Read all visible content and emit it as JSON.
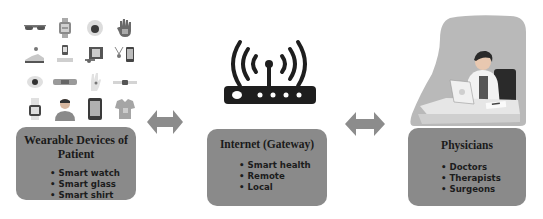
{
  "diagram": {
    "colors": {
      "box_fill": "#8a8a8a",
      "arrow_fill": "#8c8c8c",
      "router_fill": "#1e1e1e",
      "physician_bg": "#b9b9b9"
    },
    "nodes": [
      {
        "id": "patient",
        "title": "Wearable Devices of Patient",
        "title_line1": "Wearable Devices of",
        "title_line2": "Patient",
        "items": [
          "Smart watch",
          "Smart glass",
          "Smart shirt"
        ],
        "illustration": "wearable-devices-icon-grid"
      },
      {
        "id": "gateway",
        "title": "Internet (Gateway)",
        "items": [
          "Smart health",
          "Remote",
          "Local"
        ],
        "illustration": "wifi-router-icon"
      },
      {
        "id": "physicians",
        "title": "Physicians",
        "items": [
          "Doctors",
          "Therapists",
          "Surgeons"
        ],
        "illustration": "doctor-at-desk-illustration"
      }
    ],
    "edges": [
      {
        "from": "patient",
        "to": "gateway",
        "type": "bidirectional"
      },
      {
        "from": "gateway",
        "to": "physicians",
        "type": "bidirectional"
      }
    ],
    "wearable_icons": [
      "glasses-icon",
      "smartwatch-icon",
      "sensor-patch-icon",
      "smart-glove-icon",
      "smart-shoe-icon",
      "phone-stand-icon",
      "action-camera-icon",
      "pendant-phone-icon",
      "skin-sensor-icon",
      "wristband-icon",
      "hand-sensor-icon",
      "band-strip-icon",
      "watch-face-icon",
      "person-avatar-icon",
      "tablet-icon",
      "smart-shirt-icon"
    ]
  }
}
